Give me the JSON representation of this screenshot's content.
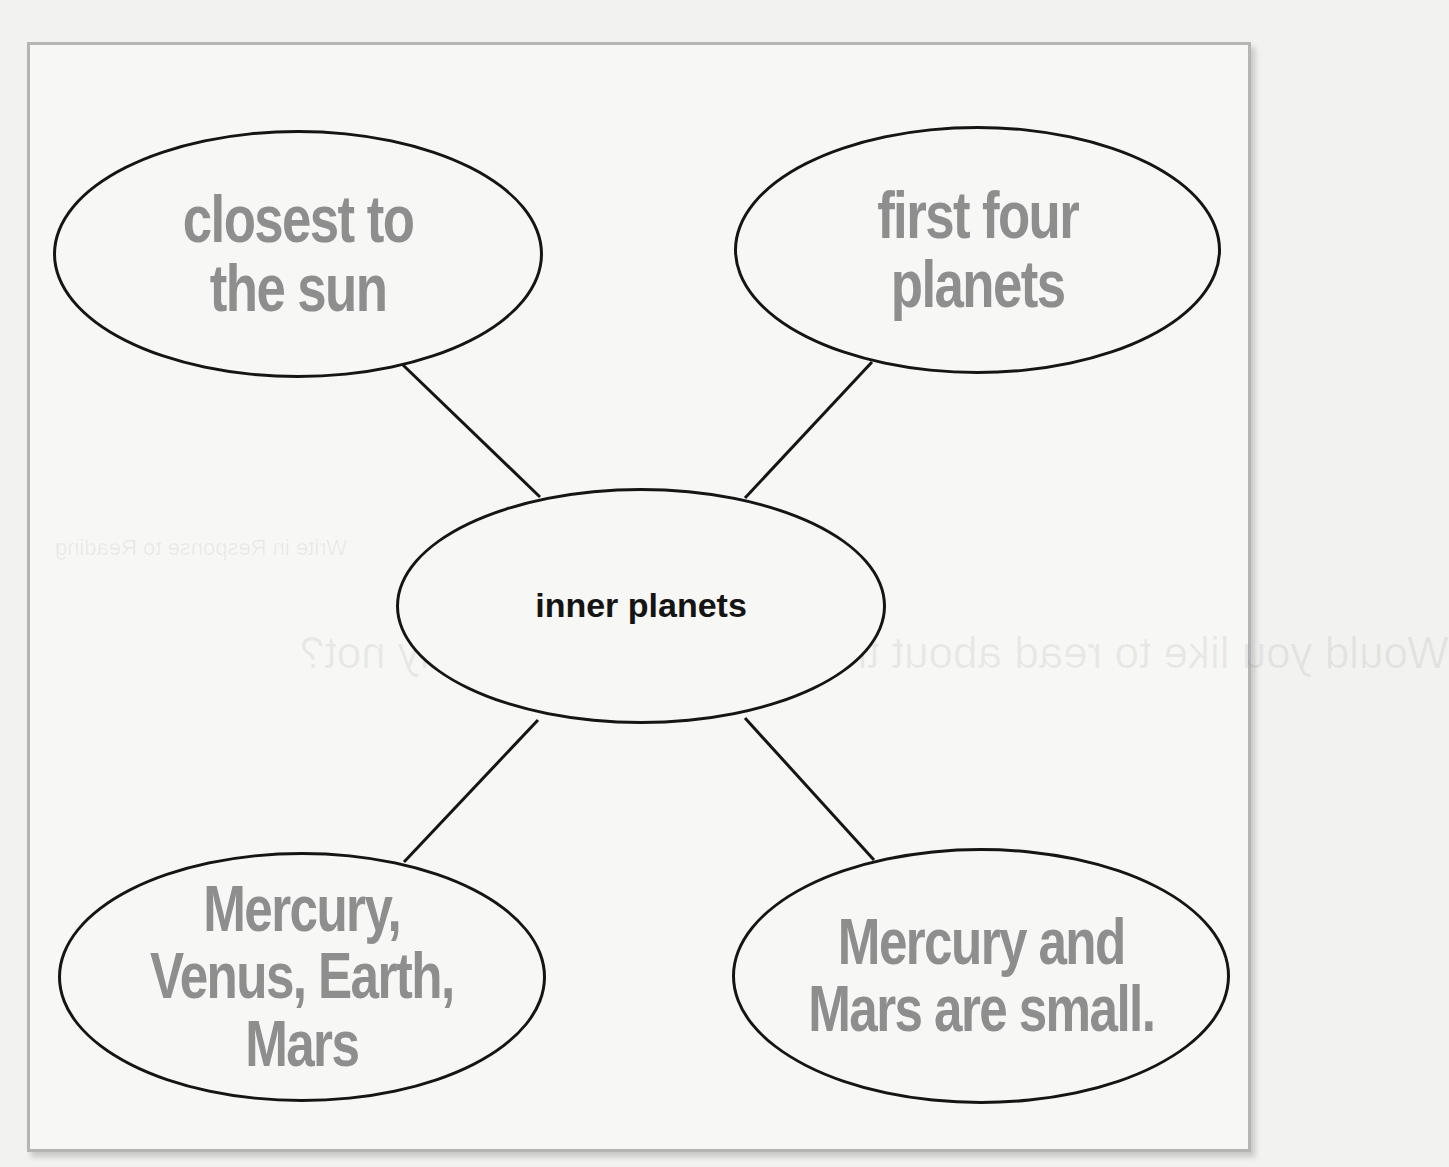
{
  "diagram": {
    "type": "concept-web",
    "center": {
      "label": "inner planets"
    },
    "nodes": [
      {
        "id": "top-left",
        "label": "closest to\nthe sun"
      },
      {
        "id": "top-right",
        "label": "first four\nplanets"
      },
      {
        "id": "bottom-left",
        "label": "Mercury,\nVenus, Earth,\nMars"
      },
      {
        "id": "bottom-right",
        "label": "Mercury and\nMars are small."
      }
    ],
    "edges": [
      {
        "from": "inner planets",
        "to": "closest to the sun"
      },
      {
        "from": "inner planets",
        "to": "first four planets"
      },
      {
        "from": "inner planets",
        "to": "Mercury, Venus, Earth, Mars"
      },
      {
        "from": "inner planets",
        "to": "Mercury and Mars are small."
      }
    ]
  },
  "show_through": {
    "heading": "Write in Response to Reading",
    "question": "Would you like to read about the planets? Why or why not?"
  },
  "colors": {
    "line": "#151515",
    "detail_text": "#8e8e8e",
    "center_text": "#141414",
    "frame_border": "#b5b5b5",
    "background": "#f7f7f6"
  }
}
